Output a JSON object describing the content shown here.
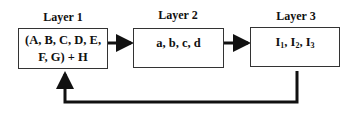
{
  "diagram": {
    "layers": [
      {
        "title": "Layer 1",
        "content_line1": "(A, B, C, D, E,",
        "content_line2": "F, G) + H"
      },
      {
        "title": "Layer 2",
        "content_line1": "a, b, c, d"
      },
      {
        "title": "Layer 3",
        "content_main": "I",
        "subs": [
          "1",
          "2",
          "3"
        ]
      }
    ],
    "edges": [
      {
        "from": "Layer 1",
        "to": "Layer 2"
      },
      {
        "from": "Layer 2",
        "to": "Layer 3"
      },
      {
        "from": "Layer 3",
        "to": "Layer 1",
        "type": "feedback"
      }
    ],
    "colors": {
      "stroke": "#111111",
      "box_border": "#333333",
      "background": "#ffffff"
    }
  }
}
